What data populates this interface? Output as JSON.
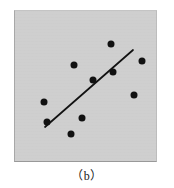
{
  "figure": {
    "caption": "（b）",
    "panel": {
      "background_color": "#cfcfcf",
      "border_color": "#a8a8a8",
      "x": 14,
      "y": 10,
      "width": 143,
      "height": 152
    }
  },
  "chart_data": {
    "type": "scatter",
    "title": "",
    "subtitle": "",
    "xlabel": "",
    "ylabel": "",
    "grid": false,
    "legend": null,
    "axis_ticks": [],
    "xlim": [
      14,
      157
    ],
    "ylim": [
      10,
      162
    ],
    "point_color": "#111111",
    "point_radius": 3.5,
    "points": [
      {
        "x": 111,
        "y": 44
      },
      {
        "x": 142,
        "y": 61
      },
      {
        "x": 74,
        "y": 65
      },
      {
        "x": 113,
        "y": 72
      },
      {
        "x": 93,
        "y": 80
      },
      {
        "x": 134,
        "y": 95
      },
      {
        "x": 44,
        "y": 102
      },
      {
        "x": 82,
        "y": 118
      },
      {
        "x": 47,
        "y": 122
      },
      {
        "x": 71,
        "y": 134
      }
    ],
    "annotations": [
      {
        "type": "trend-line",
        "name": "regression-line",
        "color": "#121212",
        "width": 1.7,
        "x1": 45,
        "y1": 127,
        "x2": 133,
        "y2": 50
      }
    ]
  }
}
